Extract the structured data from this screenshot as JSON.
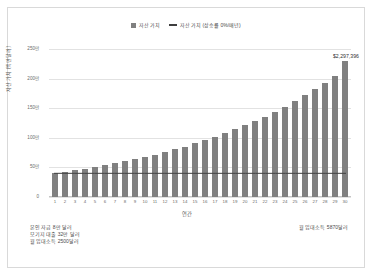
{
  "chart_data": {
    "type": "bar",
    "title": "",
    "xlabel": "연간",
    "ylabel": "자산 가치 (백만달러)",
    "ylim": [
      0,
      2500000
    ],
    "grid": true,
    "legend_position": "top-center",
    "categories": [
      "1",
      "2",
      "3",
      "4",
      "5",
      "6",
      "7",
      "8",
      "9",
      "10",
      "11",
      "12",
      "13",
      "14",
      "15",
      "16",
      "17",
      "18",
      "19",
      "20",
      "21",
      "22",
      "23",
      "24",
      "25",
      "26",
      "27",
      "28",
      "29",
      "30"
    ],
    "ytick_labels": [
      "0",
      "50만",
      "100만",
      "150만",
      "200만",
      "250만"
    ],
    "ytick_values": [
      0,
      500000,
      1000000,
      1500000,
      2000000,
      2500000
    ],
    "series": [
      {
        "name": "자산 가치",
        "type": "bar",
        "color": "#808080",
        "values": [
          400000,
          424000,
          449440,
          476406,
          504991,
          535290,
          567407,
          601452,
          637539,
          675791,
          716339,
          759319,
          804878,
          853171,
          904361,
          958623,
          1016140,
          1077109,
          1141735,
          1210239,
          1282854,
          1359825,
          1441414,
          1527899,
          1619573,
          1716747,
          1819752,
          1928937,
          2044673,
          2297396
        ]
      },
      {
        "name": "자산 가치 (상승률 0%/매년)",
        "type": "line",
        "color": "#3f3f3f",
        "values": [
          400000,
          400000,
          400000,
          400000,
          400000,
          400000,
          400000,
          400000,
          400000,
          400000,
          400000,
          400000,
          400000,
          400000,
          400000,
          400000,
          400000,
          400000,
          400000,
          400000,
          400000,
          400000,
          400000,
          400000,
          400000,
          400000,
          400000,
          400000,
          400000,
          400000
        ]
      }
    ],
    "annotations": [
      {
        "label": "$2,297,396",
        "category": "30",
        "value": 2297396
      }
    ]
  },
  "legend": {
    "items": [
      {
        "label": "자산 가치",
        "marker": "bar-swatch"
      },
      {
        "label": "자산 가치 (상승률 0%/매년)",
        "marker": "line-swatch"
      }
    ]
  },
  "captions": {
    "left_lines": [
      "본인 자금 8만 달러",
      "모기지 대출 32만 달러",
      "월 임대소득 2500달러"
    ],
    "right_lines": [
      "월 임대소득 5870달러"
    ]
  },
  "colors": {
    "bar": "#808080",
    "line": "#3f3f3f",
    "grid": "#e2e2e2",
    "frame": "#d9d9d9",
    "text": "#4a4a4a",
    "background": "#ffffff"
  }
}
